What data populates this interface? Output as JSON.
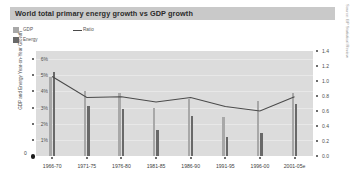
{
  "title": "World total primary energy growth vs GDP growth",
  "source_note": "Source: BP Statistical Review",
  "legend": {
    "gdp": "GDP",
    "energy": "Energy",
    "ratio": "Ratio"
  },
  "colors": {
    "gdp_bar": "#a8a8a8",
    "energy_bar": "#696969",
    "ratio_line": "#4a4a4a",
    "plot_background": "#dcdcdc",
    "title_band": "#c9c9c9"
  },
  "chart_data": {
    "type": "bar",
    "title": "World total primary energy growth vs GDP growth",
    "xlabel": "",
    "ylabel": "GDP and Energy Year-on-Year Growth",
    "y2label": "Ratio",
    "ylim": [
      0,
      6.5
    ],
    "y2lim": [
      0,
      1.4
    ],
    "grid": true,
    "legend_position": "top-left",
    "categories": [
      "1966-70",
      "1971-75",
      "1976-80",
      "1981-85",
      "1986-90",
      "1991-95",
      "1996-00",
      "2001-05e"
    ],
    "ytick_labels": [
      "1%",
      "2%",
      "3%",
      "4%",
      "5%",
      "6%"
    ],
    "ytick_values": [
      1,
      2,
      3,
      4,
      5,
      6
    ],
    "y2tick_labels": [
      "0.0",
      "0.2",
      "0.4",
      "0.6",
      "0.8",
      "1.0",
      "1.2",
      "1.4"
    ],
    "y2tick_values": [
      0.0,
      0.2,
      0.4,
      0.6,
      0.8,
      1.0,
      1.2,
      1.4
    ],
    "zero_label": "0",
    "series": [
      {
        "name": "GDP",
        "axis": "left",
        "values": [
          4.9,
          4.0,
          3.9,
          3.0,
          3.5,
          2.4,
          3.4,
          3.9
        ]
      },
      {
        "name": "Energy",
        "axis": "left",
        "values": [
          5.2,
          3.1,
          2.9,
          1.6,
          2.5,
          1.2,
          1.4,
          3.2
        ]
      },
      {
        "name": "Ratio",
        "axis": "right",
        "values": [
          1.06,
          0.78,
          0.79,
          0.72,
          0.78,
          0.66,
          0.6,
          0.79
        ]
      }
    ]
  }
}
